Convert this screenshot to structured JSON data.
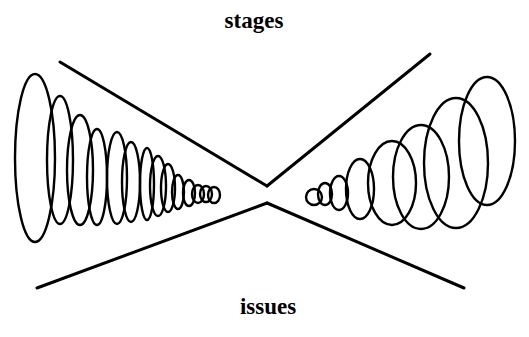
{
  "labels": {
    "top": "stages",
    "bottom": "issues"
  },
  "colors": {
    "stroke": "#000000",
    "background": "#ffffff"
  },
  "lines": {
    "top_left": {
      "x1": 60,
      "y1": 62,
      "x2": 267,
      "y2": 186
    },
    "top_right": {
      "x1": 267,
      "y1": 186,
      "x2": 430,
      "y2": 54
    },
    "bottom_left": {
      "x1": 37,
      "y1": 288,
      "x2": 267,
      "y2": 203
    },
    "bottom_right": {
      "x1": 267,
      "y1": 203,
      "x2": 464,
      "y2": 288
    }
  },
  "left_ellipses": [
    {
      "cx": 35,
      "cy": 158,
      "rx": 20,
      "ry": 84
    },
    {
      "cx": 60,
      "cy": 160,
      "rx": 13,
      "ry": 64
    },
    {
      "cx": 80,
      "cy": 170,
      "rx": 13,
      "ry": 55
    },
    {
      "cx": 97,
      "cy": 177,
      "rx": 10,
      "ry": 48
    },
    {
      "cx": 117,
      "cy": 178,
      "rx": 10,
      "ry": 46
    },
    {
      "cx": 131,
      "cy": 182,
      "rx": 9,
      "ry": 40
    },
    {
      "cx": 147,
      "cy": 184,
      "rx": 7,
      "ry": 36
    },
    {
      "cx": 158,
      "cy": 186,
      "rx": 8,
      "ry": 30
    },
    {
      "cx": 168,
      "cy": 188,
      "rx": 7,
      "ry": 24
    },
    {
      "cx": 178,
      "cy": 192,
      "rx": 6,
      "ry": 17
    },
    {
      "cx": 189,
      "cy": 193,
      "rx": 6,
      "ry": 13
    },
    {
      "cx": 198,
      "cy": 194,
      "rx": 6,
      "ry": 9
    },
    {
      "cx": 206,
      "cy": 194,
      "rx": 6,
      "ry": 8
    },
    {
      "cx": 214,
      "cy": 195,
      "rx": 6,
      "ry": 8
    }
  ],
  "right_ellipses": [
    {
      "cx": 314,
      "cy": 197,
      "rx": 8,
      "ry": 8
    },
    {
      "cx": 325,
      "cy": 194,
      "rx": 7,
      "ry": 11
    },
    {
      "cx": 339,
      "cy": 193,
      "rx": 9,
      "ry": 17
    },
    {
      "cx": 360,
      "cy": 189,
      "rx": 14,
      "ry": 30
    },
    {
      "cx": 392,
      "cy": 183,
      "rx": 24,
      "ry": 42
    },
    {
      "cx": 421,
      "cy": 177,
      "rx": 28,
      "ry": 52
    },
    {
      "cx": 456,
      "cy": 163,
      "rx": 32,
      "ry": 65
    },
    {
      "cx": 487,
      "cy": 141,
      "rx": 28,
      "ry": 64
    }
  ]
}
